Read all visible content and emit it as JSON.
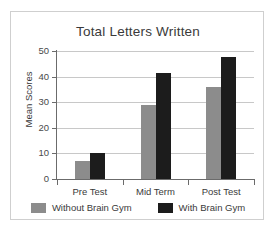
{
  "chart_data": {
    "type": "bar",
    "title": "Total Letters Written",
    "xlabel": "",
    "ylabel": "Mean Scores",
    "categories": [
      "Pre Test",
      "Mid Term",
      "Post Test"
    ],
    "series": [
      {
        "name": "Without Brain Gym",
        "color": "#8c8c8c",
        "values": [
          7,
          29,
          36
        ]
      },
      {
        "name": "With Brain Gym",
        "color": "#1c1c1c",
        "values": [
          10,
          41.5,
          47.5
        ]
      }
    ],
    "ylim": [
      0,
      50
    ],
    "yticks": [
      0,
      10,
      20,
      30,
      40,
      50
    ],
    "ytick_labels": [
      "0",
      "10",
      "20",
      "30",
      "40",
      "50"
    ],
    "grid": "horizontal",
    "legend_position": "bottom"
  }
}
